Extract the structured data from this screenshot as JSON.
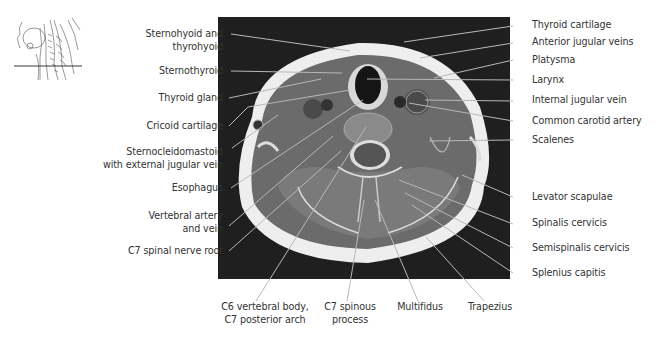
{
  "figure": {
    "orientation_thumbnail": {
      "description": "sagittal neck sketch with horizontal cut line at C7"
    },
    "image": {
      "modality": "axial MRI",
      "level": "C7"
    },
    "colors": {
      "leader_line": "#b8b8b8",
      "text": "#333333",
      "mri_background": "#1c1c1c"
    },
    "labels_left": [
      {
        "id": "sternohyoid",
        "line1": "Sternohyoid and",
        "line2": "thyrohyoid"
      },
      {
        "id": "sternothyroid",
        "line1": "Sternothyroid"
      },
      {
        "id": "thyroid-gland",
        "line1": "Thyroid gland"
      },
      {
        "id": "cricoid",
        "line1": "Cricoid cartilage"
      },
      {
        "id": "scm",
        "line1": "Sternocleidomastoid",
        "line2": "with external jugular vein"
      },
      {
        "id": "esophagus",
        "line1": "Esophagus"
      },
      {
        "id": "vertebral-artery",
        "line1": "Vertebral artery",
        "line2": "and vein"
      },
      {
        "id": "c7-nerve-root",
        "line1": "C7 spinal nerve root"
      }
    ],
    "labels_right": [
      {
        "id": "thyroid-cartilage",
        "line1": "Thyroid cartilage"
      },
      {
        "id": "anterior-jugular",
        "line1": "Anterior jugular veins"
      },
      {
        "id": "platysma",
        "line1": "Platysma"
      },
      {
        "id": "larynx",
        "line1": "Larynx"
      },
      {
        "id": "internal-jugular",
        "line1": "Internal jugular vein"
      },
      {
        "id": "common-carotid",
        "line1": "Common carotid artery"
      },
      {
        "id": "scalenes",
        "line1": "Scalenes"
      },
      {
        "id": "levator-scapulae",
        "line1": "Levator scapulae"
      },
      {
        "id": "spinalis-cervicis",
        "line1": "Spinalis cervicis"
      },
      {
        "id": "semispinalis-cervicis",
        "line1": "Semispinalis cervicis"
      },
      {
        "id": "splenius-capitis",
        "line1": "Splenius capitis"
      }
    ],
    "labels_bottom": [
      {
        "id": "c6-body",
        "line1": "C6 vertebral body,",
        "line2": "C7 posterior arch"
      },
      {
        "id": "c7-spinous",
        "line1": "C7 spinous",
        "line2": "process"
      },
      {
        "id": "multifidus",
        "line1": "Multifidus"
      },
      {
        "id": "trapezius",
        "line1": "Trapezius"
      }
    ]
  }
}
